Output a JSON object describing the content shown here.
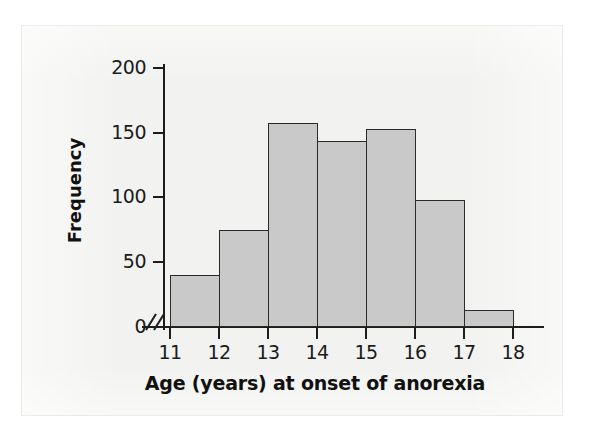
{
  "chart_data": {
    "type": "bar",
    "title": "",
    "subtitle": "",
    "xlabel": "Age (years) at onset of anorexia",
    "ylabel": "Frequency",
    "categories": [
      "11-12",
      "12-13",
      "13-14",
      "14-15",
      "15-16",
      "16-17",
      "17-18"
    ],
    "bin_edges": [
      11,
      12,
      13,
      14,
      15,
      16,
      17,
      18
    ],
    "values": [
      40,
      75,
      158,
      144,
      153,
      98,
      13
    ],
    "xtick_labels": [
      "11",
      "12",
      "13",
      "14",
      "15",
      "16",
      "17",
      "18"
    ],
    "ytick_labels": [
      "0",
      "50",
      "100",
      "150",
      "200"
    ],
    "ytick_values": [
      0,
      50,
      100,
      150,
      200
    ],
    "ylim": [
      0,
      210
    ],
    "xlim": [
      11,
      18
    ],
    "grid": false,
    "legend": null,
    "axis_break": "//",
    "bar_fill_color": "#c9c9c9",
    "bar_edge_color": "#2a2a2a",
    "axis_color": "#1d1d1d",
    "text_color": "#111111",
    "page_background": "#f2f2f0"
  }
}
